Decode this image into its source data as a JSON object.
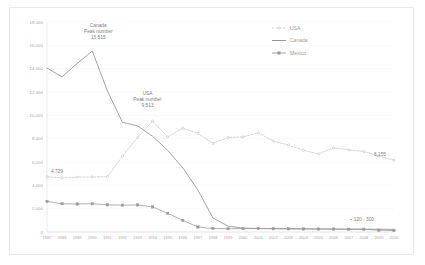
{
  "chart_data": {
    "type": "line",
    "title": "",
    "xlabel": "",
    "ylabel": "",
    "ylim": [
      0,
      18000
    ],
    "ytick_values": [
      0,
      2000,
      4000,
      6000,
      8000,
      10000,
      12000,
      14000,
      16000,
      18000
    ],
    "ytick_labels": [
      "0",
      "2,000",
      "4,000",
      "6,000",
      "8,000",
      "10,000",
      "12,000",
      "14,000",
      "16,000",
      "18,000"
    ],
    "grid": true,
    "legend_position": "top-right",
    "categories": [
      "1987",
      "1988",
      "1989",
      "1990",
      "1991",
      "1992",
      "1993",
      "1994",
      "1995",
      "1996",
      "1997",
      "1998",
      "1999",
      "2000",
      "2001",
      "2002",
      "2003",
      "2004",
      "2005",
      "2006",
      "2007",
      "2008",
      "2009",
      "2010"
    ],
    "series": [
      {
        "name": "USA",
        "style": "dashed-light-markers",
        "color": "#c8c8c8",
        "values": [
          4729,
          4650,
          4700,
          4720,
          4740,
          6500,
          8100,
          9513,
          8150,
          8900,
          8450,
          7600,
          8100,
          8150,
          8500,
          7800,
          7450,
          7000,
          6700,
          7200,
          7050,
          6900,
          6500,
          6155
        ]
      },
      {
        "name": "Canada",
        "style": "solid",
        "color": "#8c8c8c",
        "values": [
          14050,
          13300,
          14450,
          15515,
          12100,
          9400,
          9100,
          8200,
          7000,
          5500,
          3600,
          1200,
          500,
          330,
          300,
          290,
          280,
          270,
          260,
          250,
          245,
          240,
          235,
          230
        ]
      },
      {
        "name": "Mexico",
        "style": "solid-square-markers",
        "color": "#9a9a9a",
        "values": [
          2620,
          2420,
          2400,
          2420,
          2330,
          2300,
          2320,
          2150,
          1600,
          1000,
          430,
          300,
          280,
          290,
          300,
          280,
          270,
          260,
          255,
          250,
          240,
          230,
          160,
          120
        ]
      }
    ],
    "annotations": [
      {
        "id": "canada-peak",
        "lines": [
          "Canada",
          "Peak number",
          "15,515"
        ],
        "x": 1990,
        "y": 15515
      },
      {
        "id": "usa-peak",
        "lines": [
          "USA",
          "Peak number",
          "9,513"
        ],
        "x": 1994,
        "y": 9513
      },
      {
        "id": "usa-start-label",
        "lines": [
          "4,729"
        ],
        "x": 1987,
        "y": 4729
      },
      {
        "id": "usa-end-label",
        "lines": [
          "6,155"
        ],
        "x": 2010,
        "y": 6155
      },
      {
        "id": "mexico-range-label",
        "lines": [
          "~ 120 - 300"
        ],
        "x": 2008,
        "y": 300
      }
    ],
    "legend": [
      {
        "name": "USA",
        "color": "#c8c8c8"
      },
      {
        "name": "Canada",
        "color": "#8c8c8c"
      },
      {
        "name": "Mexico",
        "color": "#9a9a9a"
      }
    ]
  }
}
